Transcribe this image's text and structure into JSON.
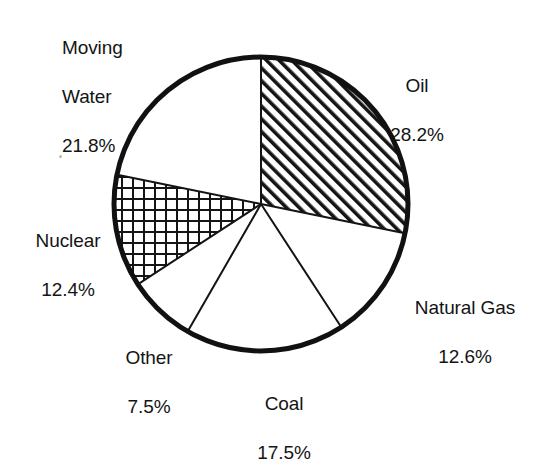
{
  "chart_data": {
    "type": "pie",
    "title": "",
    "subtitle": "",
    "xlabel": "",
    "ylabel": "",
    "legend_position": "none",
    "grid": false,
    "units": "percent",
    "start_angle_deg": 0,
    "direction": "clockwise",
    "center": {
      "x": 261,
      "y": 204
    },
    "radius": 148,
    "categories": [
      "Oil",
      "Natural Gas",
      "Coal",
      "Other",
      "Nuclear",
      "Moving Water"
    ],
    "values": [
      28.2,
      12.6,
      17.5,
      7.5,
      12.4,
      21.8
    ],
    "slices": [
      {
        "key": "oil",
        "label": "Oil",
        "value": 28.2,
        "value_text": "28.2%",
        "fill": "diagonal-hatch",
        "start_deg": 0.0,
        "end_deg": 101.5,
        "label_align": "center"
      },
      {
        "key": "natural-gas",
        "label": "Natural Gas",
        "value": 12.6,
        "value_text": "12.6%",
        "fill": "white",
        "start_deg": 101.5,
        "end_deg": 146.9,
        "label_align": "center"
      },
      {
        "key": "coal",
        "label": "Coal",
        "value": 17.5,
        "value_text": "17.5%",
        "fill": "stipple-dots",
        "start_deg": 146.9,
        "end_deg": 209.9,
        "label_align": "center"
      },
      {
        "key": "other",
        "label": "Other",
        "value": 7.5,
        "value_text": "7.5%",
        "fill": "white",
        "start_deg": 209.9,
        "end_deg": 236.9,
        "label_align": "center"
      },
      {
        "key": "nuclear",
        "label": "Nuclear",
        "value": 12.4,
        "value_text": "12.4%",
        "fill": "crosshatch-grid",
        "start_deg": 236.9,
        "end_deg": 281.5,
        "label_align": "center"
      },
      {
        "key": "moving-water",
        "label": "Moving\nWater",
        "label_line1": "Moving",
        "label_line2": "Water",
        "value": 21.8,
        "value_text": "21.8%",
        "fill": "white",
        "start_deg": 281.5,
        "end_deg": 360.0,
        "label_align": "left"
      }
    ],
    "colors": {
      "ink": "#111111",
      "background": "#ffffff",
      "outline": "#111111",
      "divider": "#111111"
    }
  }
}
